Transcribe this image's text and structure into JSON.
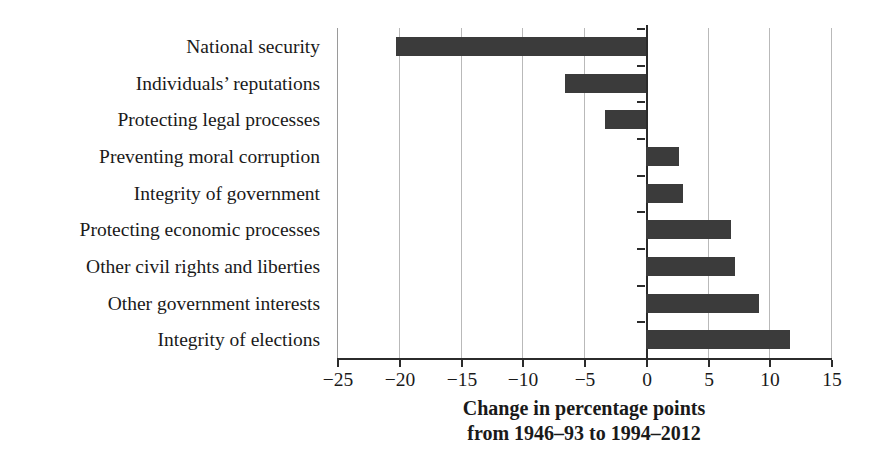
{
  "chart_data": {
    "type": "bar",
    "orientation": "horizontal",
    "title": "",
    "subtitle": "",
    "xlabel_lines": [
      "Change in percentage points",
      "from 1946–93 to 1994–2012"
    ],
    "ylabel": "",
    "xlim": [
      -25,
      15
    ],
    "ylim": null,
    "grid": true,
    "legend": null,
    "xticks": [
      -25,
      -20,
      -15,
      -10,
      -5,
      0,
      5,
      10,
      15
    ],
    "xtick_labels": [
      "−25",
      "−20",
      "−15",
      "−10",
      "−5",
      "0",
      "5",
      "10",
      "15"
    ],
    "categories": [
      "National security",
      "Individuals’ reputations",
      "Protecting legal processes",
      "Preventing moral corruption",
      "Integrity of government",
      "Protecting economic processes",
      "Other civil rights and liberties",
      "Other government interests",
      "Integrity of elections"
    ],
    "values": [
      -20.2,
      -6.5,
      -3.3,
      2.7,
      3.0,
      6.9,
      7.2,
      9.2,
      11.7
    ],
    "bar_color": "#3b3b3b",
    "gridline_color": "#b9b9b9",
    "axis_color": "#2b2b2b"
  }
}
